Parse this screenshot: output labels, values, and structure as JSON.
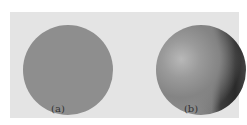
{
  "figure": {
    "panels": [
      {
        "label": "(a)",
        "description": "flat-shaded sphere",
        "color": "#8e8e8e"
      },
      {
        "label": "(b)",
        "description": "smooth-shaded sphere with specular highlight",
        "color": "#8a8a8a"
      }
    ],
    "background": "#e4e4e4"
  }
}
